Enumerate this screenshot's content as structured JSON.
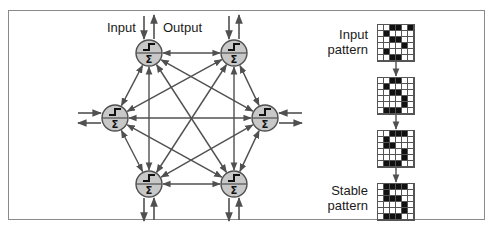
{
  "network": {
    "input_label": "Input",
    "output_label": "Output",
    "node_fill": "#c8c8c8",
    "line_color": "#505050",
    "nodes": [
      {
        "id": "top-left",
        "x": 149,
        "y": 53
      },
      {
        "id": "top-right",
        "x": 234,
        "y": 53
      },
      {
        "id": "left",
        "x": 115,
        "y": 118
      },
      {
        "id": "right",
        "x": 265,
        "y": 118
      },
      {
        "id": "bottom-left",
        "x": 149,
        "y": 184
      },
      {
        "id": "bottom-right",
        "x": 234,
        "y": 184
      }
    ],
    "node_symbols": {
      "activation": "step",
      "sum": "Σ"
    }
  },
  "patterns": {
    "input_label_line1": "Input",
    "input_label_line2": "pattern",
    "stable_label_line1": "Stable",
    "stable_label_line2": "pattern",
    "grids": [
      [
        [
          0,
          0,
          1,
          1,
          0,
          1
        ],
        [
          0,
          1,
          0,
          0,
          0,
          0
        ],
        [
          0,
          0,
          1,
          1,
          0,
          0
        ],
        [
          0,
          0,
          0,
          0,
          1,
          0
        ],
        [
          0,
          1,
          0,
          0,
          0,
          0
        ],
        [
          0,
          0,
          1,
          1,
          0,
          0
        ]
      ],
      [
        [
          0,
          0,
          1,
          1,
          0,
          0
        ],
        [
          0,
          1,
          0,
          0,
          0,
          0
        ],
        [
          0,
          0,
          1,
          1,
          0,
          0
        ],
        [
          0,
          0,
          0,
          0,
          1,
          0
        ],
        [
          0,
          0,
          0,
          0,
          1,
          0
        ],
        [
          0,
          1,
          1,
          1,
          0,
          0
        ]
      ],
      [
        [
          0,
          0,
          1,
          1,
          1,
          0
        ],
        [
          0,
          1,
          0,
          0,
          0,
          0
        ],
        [
          0,
          1,
          1,
          0,
          0,
          0
        ],
        [
          0,
          0,
          0,
          0,
          1,
          0
        ],
        [
          0,
          0,
          0,
          0,
          1,
          0
        ],
        [
          0,
          1,
          1,
          1,
          0,
          0
        ]
      ],
      [
        [
          0,
          1,
          1,
          1,
          1,
          0
        ],
        [
          0,
          1,
          0,
          0,
          0,
          0
        ],
        [
          0,
          1,
          1,
          1,
          0,
          0
        ],
        [
          0,
          0,
          0,
          0,
          1,
          0
        ],
        [
          0,
          0,
          0,
          0,
          1,
          0
        ],
        [
          0,
          1,
          1,
          1,
          0,
          0
        ]
      ]
    ]
  }
}
